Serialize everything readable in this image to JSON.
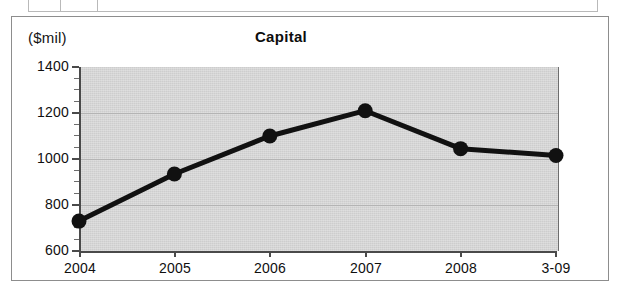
{
  "table_fragment": {
    "name": "cut-off-table-row",
    "cells": [
      "",
      "",
      "",
      "",
      "",
      ""
    ]
  },
  "card": {
    "unit_label": "($mil)",
    "title": "Capital"
  },
  "chart_data": {
    "type": "line",
    "title": "Capital",
    "subtitle": "",
    "xlabel": "",
    "ylabel": "($mil)",
    "unit": "$mil",
    "categories": [
      "2004",
      "2005",
      "2006",
      "2007",
      "2008",
      "3-09"
    ],
    "values": [
      730,
      935,
      1100,
      1210,
      1045,
      1015
    ],
    "series": [
      {
        "name": "Capital",
        "values": [
          730,
          935,
          1100,
          1210,
          1045,
          1015
        ]
      }
    ],
    "ylim": [
      600,
      1400
    ],
    "ytick_labels": [
      "1400",
      "1200",
      "1000",
      "800",
      "600"
    ],
    "yticks": [
      1400,
      1200,
      1000,
      800,
      600
    ],
    "ytick_step": 200,
    "yminor_step": 50,
    "grid": true,
    "grid_axis": "y",
    "legend": false,
    "legend_position": "none",
    "marker": "circle",
    "line_color": "#111111",
    "marker_color": "#111111",
    "plot_background": "#cdcdcd",
    "axis_color": "#4a4a4a",
    "gridline_color": "#b4b4b4"
  }
}
